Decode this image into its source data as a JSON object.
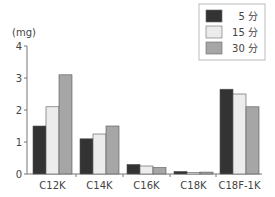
{
  "chart_data": {
    "type": "bar",
    "title": "",
    "xlabel": "",
    "ylabel": "(mg)",
    "ylim": [
      0,
      4
    ],
    "yticks": [
      0,
      1,
      2,
      3,
      4
    ],
    "grid": false,
    "legend_position": "top-right",
    "categories": [
      "C12K",
      "C14K",
      "C16K",
      "C18K",
      "C18F-1K"
    ],
    "series": [
      {
        "name": "5 分",
        "color": "#333333",
        "values": [
          1.5,
          1.1,
          0.3,
          0.08,
          2.65
        ]
      },
      {
        "name": "15 分",
        "color": "#ececec",
        "values": [
          2.1,
          1.25,
          0.25,
          0.05,
          2.5
        ]
      },
      {
        "name": "30 分",
        "color": "#a6a6a6",
        "values": [
          3.1,
          1.5,
          0.2,
          0.06,
          2.1
        ]
      }
    ]
  },
  "legend": {
    "items": [
      {
        "label": "5 分"
      },
      {
        "label": "15 分"
      },
      {
        "label": "30 分"
      }
    ]
  },
  "axis": {
    "unit": "(mg)",
    "ticks": [
      "0",
      "1",
      "2",
      "3",
      "4"
    ]
  },
  "categories": [
    "C12K",
    "C14K",
    "C16K",
    "C18K",
    "C18F-1K"
  ]
}
